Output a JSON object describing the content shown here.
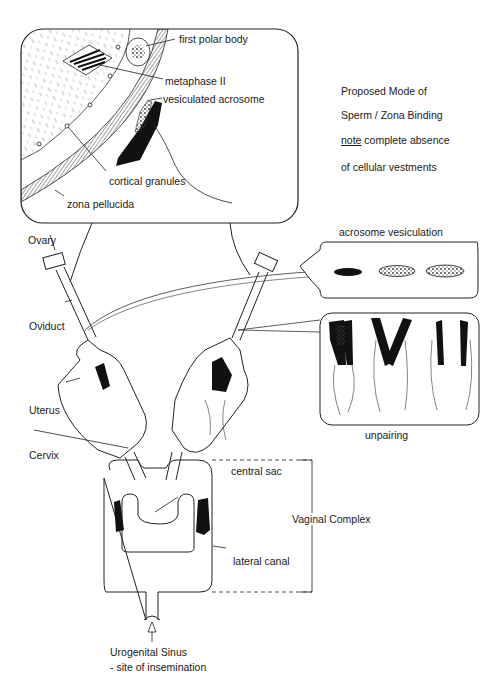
{
  "title_block": {
    "line1": "Proposed Mode of",
    "line2": "Sperm / Zona Binding",
    "note_word": "note",
    "line3_rest": " complete absence",
    "line4": "of cellular vestments"
  },
  "zoom_panel": {
    "labels": {
      "first_polar_body": "first polar body",
      "metaphase_ii": "metaphase II",
      "vesiculated_acrosome": "vesiculated acrosome",
      "cortical_granules": "cortical  granules",
      "zona_pellucida": "zona pellucida"
    }
  },
  "anatomy": {
    "ovary": "Ovary",
    "oviduct": "Oviduct",
    "uterus": "Uterus",
    "cervix": "Cervix",
    "central_sac": "central sac",
    "vaginal_complex": "Vaginal Complex",
    "lateral_canal": "lateral canal",
    "urogenital_sinus": "Urogenital Sinus",
    "insemination": "- site of insemination"
  },
  "insets": {
    "acrosome_vesiculation": "acrosome vesiculation",
    "unpairing": "unpairing"
  },
  "colors": {
    "ink": "#1a1a1a",
    "background": "#ffffff",
    "hatch": "#888888"
  }
}
